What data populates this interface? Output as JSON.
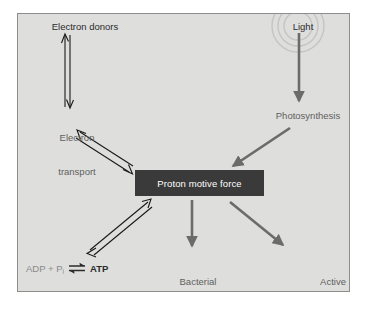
{
  "figure": {
    "panel_background": "#dededc",
    "panel_border": "#8d8d8d",
    "page_background": "#ffffff"
  },
  "colors": {
    "dark_text": "#2b2b2b",
    "gray_text": "#5f5f5f",
    "light_text": "#8e8e8e",
    "box_fill": "#3a3a3a",
    "box_text": "#ffffff",
    "open_arrow_stroke": "#1a1a1a",
    "solid_arrow_fill": "#6b6b6b",
    "light_rays": "#c4c4c2"
  },
  "nodes": {
    "electron_donors": {
      "label": "Electron donors",
      "style": "dark"
    },
    "light": {
      "label": "Light",
      "style": "dark",
      "decoration": "radiating-arcs"
    },
    "electron_transport": {
      "label": "Electron\ntransport",
      "line1": "Electron",
      "line2": "transport",
      "style": "gray"
    },
    "photosynthesis": {
      "label": "Photosynthesis",
      "style": "gray"
    },
    "proton_motive_force": {
      "label": "Proton motive force",
      "style": "inverted-box"
    },
    "bacterial_flagella_rotation": {
      "label": "Bacterial\nflagella\nrotation",
      "line1": "Bacterial",
      "line2": "flagella",
      "line3": "rotation",
      "style": "gray"
    },
    "active_transport": {
      "label": "Active\ntransport",
      "line1": "Active",
      "line2": "transport",
      "style": "gray"
    }
  },
  "atp_reaction": {
    "reactants_prefix": "ADP + P",
    "reactants_subscript": "i",
    "arrow": "equilibrium-double-harpoon",
    "products": "ATP"
  },
  "edges": [
    {
      "id": "donors-transport",
      "from": "electron_donors",
      "to": "electron_transport",
      "style": "open-double-line",
      "heads": "both",
      "orientation": "vertical"
    },
    {
      "id": "light-photosynthesis",
      "from": "light",
      "to": "photosynthesis",
      "style": "solid",
      "heads": "end",
      "orientation": "vertical"
    },
    {
      "id": "transport-pmf",
      "from": "electron_transport",
      "to": "proton_motive_force",
      "style": "open-double-line",
      "heads": "both",
      "orientation": "diagonal"
    },
    {
      "id": "photosynthesis-pmf",
      "from": "photosynthesis",
      "to": "proton_motive_force",
      "style": "solid",
      "heads": "end",
      "orientation": "diagonal"
    },
    {
      "id": "pmf-atp",
      "from": "proton_motive_force",
      "to": "atp_reaction",
      "style": "open-double-line",
      "heads": "both",
      "orientation": "diagonal"
    },
    {
      "id": "pmf-flagella",
      "from": "proton_motive_force",
      "to": "bacterial_flagella_rotation",
      "style": "solid",
      "heads": "end",
      "orientation": "vertical"
    },
    {
      "id": "pmf-active-transport",
      "from": "proton_motive_force",
      "to": "active_transport",
      "style": "solid",
      "heads": "end",
      "orientation": "diagonal"
    }
  ]
}
